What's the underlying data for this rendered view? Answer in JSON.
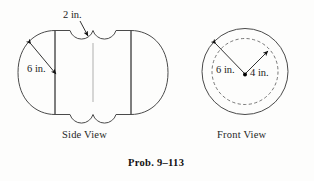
{
  "figure": {
    "caption": "Prob. 9–113",
    "background_color": "#fdfdfc",
    "line_color": "#4a4a4a",
    "body_fill_light": "#f2f2f2",
    "body_fill_mid": "#c8c8c8",
    "body_fill_dark": "#8f8f8f"
  },
  "side_view": {
    "label": "Side View",
    "dimensions": [
      {
        "id": "notch-radius",
        "text": "2 in.",
        "refers_to": "groove-notch-radius"
      },
      {
        "id": "sphere-radius",
        "text": "6 in.",
        "refers_to": "end-cap-radius"
      }
    ]
  },
  "front_view": {
    "label": "Front View",
    "dimensions": [
      {
        "id": "outer-radius",
        "text": "6 in.",
        "refers_to": "outer-circle-radius"
      },
      {
        "id": "inner-radius",
        "text": "4 in.",
        "refers_to": "dashed-inner-circle-radius"
      }
    ]
  }
}
